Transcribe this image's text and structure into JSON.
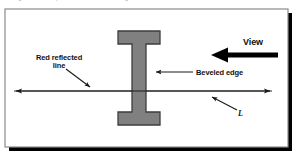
{
  "figure": {
    "background_color": "#ffffff",
    "frame": {
      "border_color": "#8a8a8a",
      "shadow_color": "#000000",
      "fill_color": "#ffffff"
    },
    "top_cut_text": "g      p            g"
  },
  "labels": {
    "red_reflected_line": "Red reflected\nline",
    "beveled_edge": "Beveled edge",
    "view": "View",
    "length": "L"
  },
  "colors": {
    "beam_fill": "#808080",
    "beam_stroke": "#3d3d3d",
    "line_color": "#1a1a1a",
    "reflected_line_color": "#6e6e6e",
    "text_color": "#111111"
  },
  "shapes": {
    "i_beam": {
      "name": "I-beam cross section",
      "top_flange": {
        "x": 118,
        "y": 31,
        "w": 42,
        "h": 13
      },
      "web": {
        "x": 132,
        "y": 44,
        "w": 14,
        "h": 68
      },
      "bottom_flange": {
        "x": 118,
        "y": 112,
        "w": 42,
        "h": 13
      }
    },
    "dimension_line": {
      "name": "horizontal double-headed dimension line",
      "x1": 14,
      "x2": 272,
      "y": 91,
      "arrowheads": "both"
    },
    "view_arrow": {
      "name": "thick left-pointing view direction arrow",
      "x_tail": 278,
      "x_head": 213,
      "y": 55,
      "thickness": 5
    },
    "beveled_edge_leader": {
      "name": "left-pointing leader arrow to beam web",
      "x_tail": 193,
      "x_head": 152,
      "y": 72
    },
    "red_line_leader": {
      "name": "diagonal leader from red reflected line label",
      "x1": 66,
      "y1": 70,
      "x2": 92,
      "y2": 89
    },
    "length_leader": {
      "name": "diagonal leader from L label",
      "x1": 236,
      "y1": 112,
      "x2": 210,
      "y2": 98
    }
  }
}
